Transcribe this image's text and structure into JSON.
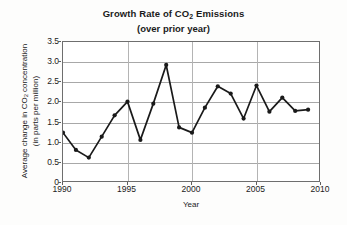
{
  "chart_data": {
    "type": "line",
    "title": "Growth Rate of CO2 Emissions",
    "title_line1_pre": "Growth Rate of CO",
    "title_line1_sub": "2",
    "title_line1_post": " Emissions",
    "subtitle": "(over prior year)",
    "xlabel": "Year",
    "ylabel": "Average change in CO2 concentration (in parts per million)",
    "ylabel_line1_pre": "Average change in CO",
    "ylabel_line1_sub": "2",
    "ylabel_line1_post": " concentration",
    "ylabel_line2": "(in parts per million)",
    "grid": true,
    "legend": null,
    "xlim": [
      1990,
      2010
    ],
    "ylim": [
      0,
      3.5
    ],
    "xticks": [
      "1990",
      "1995",
      "2000",
      "2005",
      "2010"
    ],
    "xtick_values": [
      1990,
      1995,
      2000,
      2005,
      2010
    ],
    "yticks": [
      "0",
      "0.5",
      "1.0",
      "1.5",
      "2.0",
      "2.5",
      "3.0",
      "3.5"
    ],
    "ytick_values": [
      0,
      0.5,
      1.0,
      1.5,
      2.0,
      2.5,
      3.0,
      3.5
    ],
    "x": [
      1990,
      1991,
      1992,
      1993,
      1994,
      1995,
      1996,
      1997,
      1998,
      1999,
      2000,
      2001,
      2002,
      2003,
      2004,
      2005,
      2006,
      2007,
      2008,
      2009
    ],
    "values": [
      1.25,
      0.82,
      0.63,
      1.15,
      1.68,
      2.02,
      1.07,
      1.97,
      2.93,
      1.38,
      1.25,
      1.87,
      2.4,
      2.22,
      1.6,
      2.42,
      1.77,
      2.12,
      1.79,
      1.82
    ],
    "series": [
      {
        "name": "Average change in CO2 concentration",
        "values": [
          1.25,
          0.82,
          0.63,
          1.15,
          1.68,
          2.02,
          1.07,
          1.97,
          2.93,
          1.38,
          1.25,
          1.87,
          2.4,
          2.22,
          1.6,
          2.42,
          1.77,
          2.12,
          1.79,
          1.82
        ]
      }
    ],
    "marker": "filled-circle",
    "line_color": "#1a1a1a",
    "marker_color": "#1a1a1a",
    "grid_color": "#a8a8a8",
    "axis_color": "#6e6e6e",
    "background_color": "#ffffff",
    "figure_background_color": "#fdfdfc"
  }
}
